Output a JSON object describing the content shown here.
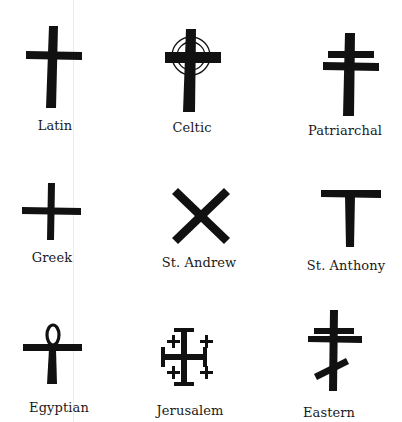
{
  "colors": {
    "ink": "#111111",
    "background": "#ffffff"
  },
  "crosses": [
    {
      "id": "latin",
      "label": "Latin",
      "label_x": 55,
      "label_y": 118
    },
    {
      "id": "celtic",
      "label": "Celtic",
      "label_x": 192,
      "label_y": 120
    },
    {
      "id": "patriarchal",
      "label": "Patriarchal",
      "label_x": 345,
      "label_y": 123
    },
    {
      "id": "greek",
      "label": "Greek",
      "label_x": 52,
      "label_y": 250
    },
    {
      "id": "st-andrew",
      "label": "St. Andrew",
      "label_x": 199,
      "label_y": 255
    },
    {
      "id": "st-anthony",
      "label": "St. Anthony",
      "label_x": 346,
      "label_y": 258
    },
    {
      "id": "egyptian",
      "label": "Egyptian",
      "label_x": 59,
      "label_y": 400
    },
    {
      "id": "jerusalem",
      "label": "Jerusalem",
      "label_x": 190,
      "label_y": 403
    },
    {
      "id": "eastern",
      "label": "Eastern",
      "label_x": 329,
      "label_y": 405
    }
  ]
}
